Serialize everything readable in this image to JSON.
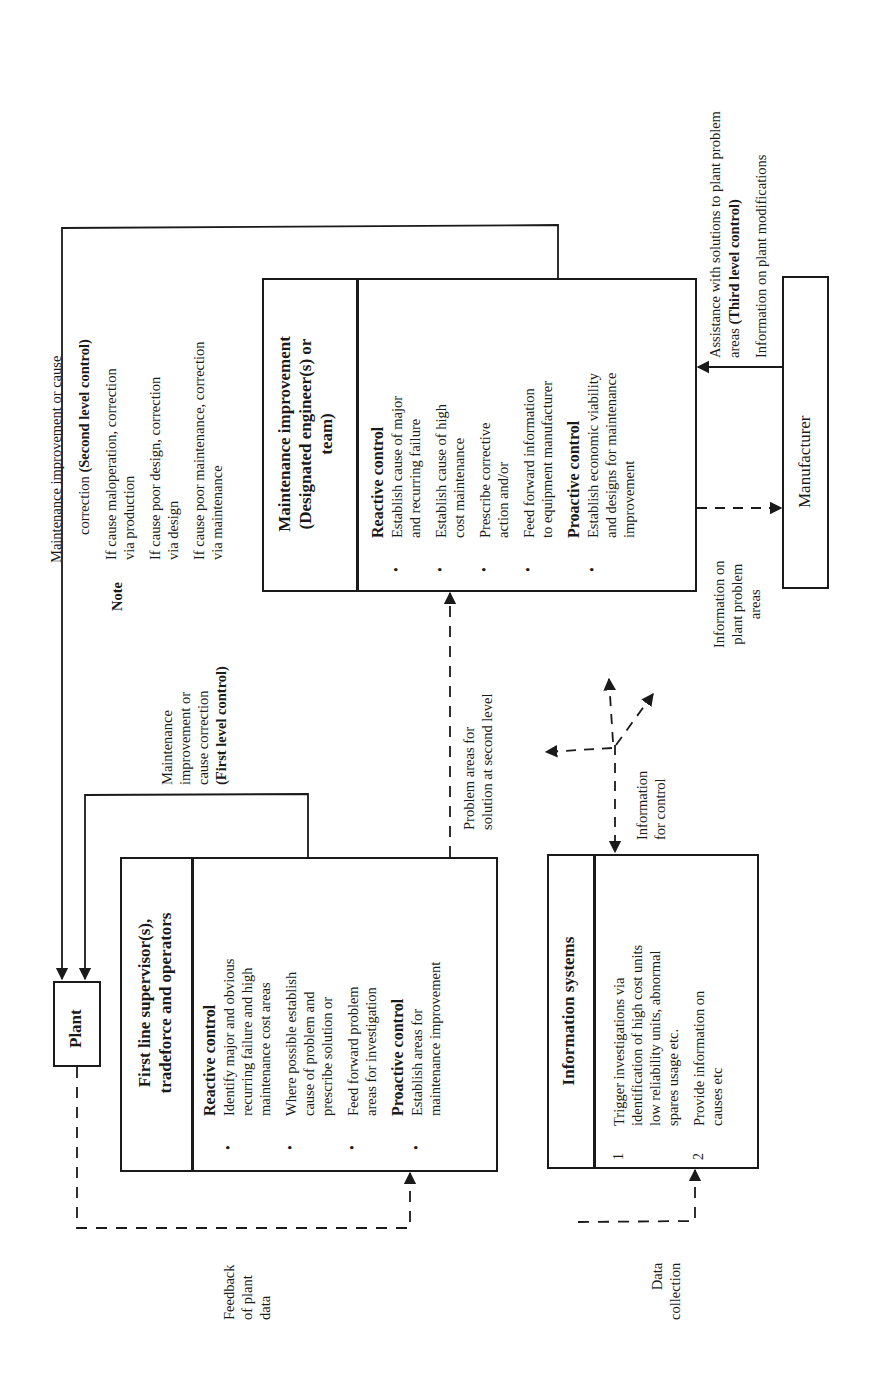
{
  "diagram": {
    "orientation": "rotated 90 degrees counter-clockwise",
    "nodes": {
      "plant": {
        "label": "Plant"
      },
      "first_line": {
        "title_lines": [
          "First line supervisor(s),",
          "tradeforce and operators"
        ],
        "reactive_heading": "Reactive control",
        "reactive_items": [
          [
            "Identify major and obvious",
            "recurring failure and high",
            "maintenance cost areas"
          ],
          [
            "Where possible establish",
            "cause of problem and",
            "prescribe solution or"
          ],
          [
            "Feed forward problem",
            "areas for investigation"
          ]
        ],
        "proactive_heading": "Proactive control",
        "proactive_items": [
          [
            "Establish areas for",
            "maintenance improvement"
          ]
        ],
        "bullet": "•"
      },
      "maintenance_improvement": {
        "title_lines": [
          "Maintenance improvement",
          "(Designated engineer(s) or",
          "team)"
        ],
        "reactive_heading": "Reactive control",
        "reactive_items": [
          [
            "Establish cause of major",
            "and recurring failure"
          ],
          [
            "Establish cause of high",
            "cost maintenance"
          ],
          [
            "Prescribe corrective",
            "action and/or"
          ],
          [
            "Feed forward information",
            "to equipment manufacturer"
          ]
        ],
        "proactive_heading": "Proactive control",
        "proactive_items": [
          [
            "Establish economic viability",
            "and designs for maintenance",
            "improvement"
          ]
        ],
        "bullet": "•"
      },
      "information_systems": {
        "title": "Information systems",
        "items": [
          {
            "num": "1",
            "lines": [
              "Trigger investigations via",
              "identification of high cost units",
              "low reliability units, abnormal",
              "spares usage etc."
            ]
          },
          {
            "num": "2",
            "lines": [
              "Provide information on",
              "causes etc"
            ]
          }
        ]
      },
      "manufacturer": {
        "label": "Manufacturer"
      }
    },
    "edge_labels": {
      "second_level": {
        "line1": "Maintenance improvement or cause",
        "line2_prefix": "correction ",
        "line2_bold": "(Second level control)"
      },
      "note": {
        "label": "Note",
        "items": [
          [
            "If cause maloperation, correction",
            "via production"
          ],
          [
            "If cause poor design, correction",
            "via design"
          ],
          [
            "If cause poor maintenance, correction",
            "via maintenance"
          ]
        ]
      },
      "first_level": {
        "lines": [
          "Maintenance",
          "improvement or",
          "cause correction"
        ],
        "bold": "(First level control)"
      },
      "problem_areas": [
        "Problem areas for",
        "solution at second level"
      ],
      "info_for_control": [
        "Information",
        "for control"
      ],
      "info_problem_areas": [
        "Information on",
        "plant problem",
        "areas"
      ],
      "third_level": {
        "line1": "Assistance with solutions to plant problem",
        "line2_prefix": "areas ",
        "line2_bold": "(Third level control)",
        "line3": "Information on plant modifications"
      },
      "feedback": [
        "Feedback",
        "of plant",
        "data"
      ],
      "data_collection": [
        "Data",
        "collection"
      ]
    }
  }
}
